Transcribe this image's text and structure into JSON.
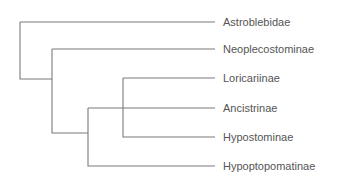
{
  "diagram": {
    "type": "phylogenetic-tree",
    "line_color": "#7a7a7a",
    "text_color": "#555555",
    "taxa": [
      {
        "label": "Astroblebidae",
        "y": 22
      },
      {
        "label": "Neoplecostominae",
        "y": 49
      },
      {
        "label": "Loricariinae",
        "y": 78
      },
      {
        "label": "Ancistrinae",
        "y": 108
      },
      {
        "label": "Hypostominae",
        "y": 137
      },
      {
        "label": "Hypoptopomatinae",
        "y": 166
      }
    ],
    "topology": "(Astroblebidae, (Neoplecostominae, ((Loricariinae, Hypostominae), Ancistrinae, Hypoptopomatinae)))"
  }
}
